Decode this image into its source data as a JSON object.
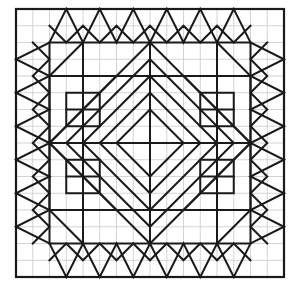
{
  "figure": {
    "title": "Geometric quilt block tessellation pattern",
    "canvas": {
      "width": 298,
      "height": 288
    },
    "plot_area": {
      "x": 16,
      "y": 9,
      "width": 268,
      "height": 268
    },
    "grid": {
      "cells_x": 16,
      "cells_y": 16,
      "cell_size": 16.75
    },
    "colors": {
      "background": "#ffffff",
      "minor_grid": "#c9c9c9",
      "major_line": "#1a1a1a",
      "border": "#1a1a1a"
    },
    "stroke_widths": {
      "minor_grid": 0.8,
      "major_line": 2.0,
      "border": 2.2
    }
  },
  "chart_data": {
    "type": "line",
    "title": "Geometric quilt block tessellation pattern",
    "xlabel": "",
    "ylabel": "",
    "xlim": [
      0,
      16
    ],
    "ylim": [
      0,
      16
    ],
    "grid": true,
    "legend": "none",
    "units": "grid cells",
    "minor_grid_lines": {
      "x": [
        0,
        1,
        2,
        3,
        4,
        5,
        6,
        7,
        8,
        9,
        10,
        11,
        12,
        13,
        14,
        15,
        16
      ],
      "y": [
        0,
        1,
        2,
        3,
        4,
        5,
        6,
        7,
        8,
        9,
        10,
        11,
        12,
        13,
        14,
        15,
        16
      ]
    },
    "series": [
      {
        "name": "outer-border",
        "closed": true,
        "points": [
          [
            0,
            0
          ],
          [
            16,
            0
          ],
          [
            16,
            16
          ],
          [
            0,
            16
          ]
        ]
      },
      {
        "name": "inner-frame-square",
        "closed": true,
        "points": [
          [
            2,
            2
          ],
          [
            14,
            2
          ],
          [
            14,
            14
          ],
          [
            2,
            14
          ]
        ]
      },
      {
        "name": "diamond-ring-1-outer",
        "closed": true,
        "points": [
          [
            8,
            2
          ],
          [
            14,
            8
          ],
          [
            8,
            14
          ],
          [
            2,
            8
          ]
        ]
      },
      {
        "name": "diamond-ring-2",
        "closed": true,
        "points": [
          [
            8,
            3
          ],
          [
            13,
            8
          ],
          [
            8,
            13
          ],
          [
            3,
            8
          ]
        ]
      },
      {
        "name": "diamond-ring-3",
        "closed": true,
        "points": [
          [
            8,
            4
          ],
          [
            12,
            8
          ],
          [
            8,
            12
          ],
          [
            4,
            8
          ]
        ]
      },
      {
        "name": "diamond-ring-4",
        "closed": true,
        "points": [
          [
            8,
            5
          ],
          [
            11,
            8
          ],
          [
            8,
            11
          ],
          [
            5,
            8
          ]
        ]
      },
      {
        "name": "diamond-ring-5-inner",
        "closed": true,
        "points": [
          [
            8,
            6
          ],
          [
            10,
            8
          ],
          [
            8,
            10
          ],
          [
            6,
            8
          ]
        ]
      },
      {
        "name": "center-vertical-axis",
        "closed": false,
        "points": [
          [
            8,
            2
          ],
          [
            8,
            14
          ]
        ]
      },
      {
        "name": "center-horizontal-axis",
        "closed": false,
        "points": [
          [
            2,
            8
          ],
          [
            14,
            8
          ]
        ]
      },
      {
        "name": "inner-frame-band-top",
        "closed": false,
        "points": [
          [
            2,
            4
          ],
          [
            14,
            4
          ]
        ]
      },
      {
        "name": "inner-frame-band-bottom",
        "closed": false,
        "points": [
          [
            2,
            12
          ],
          [
            14,
            12
          ]
        ]
      },
      {
        "name": "inner-frame-band-left",
        "closed": false,
        "points": [
          [
            4,
            2
          ],
          [
            4,
            14
          ]
        ]
      },
      {
        "name": "inner-frame-band-right",
        "closed": false,
        "points": [
          [
            12,
            2
          ],
          [
            12,
            14
          ]
        ]
      }
    ],
    "edge_bands": {
      "top": {
        "baseline_y": 2,
        "outer_y": 0,
        "peaks_x": [
          3,
          5,
          7,
          9,
          11,
          13
        ],
        "valleys_x": [
          2,
          4,
          6,
          8,
          10,
          12,
          14
        ]
      },
      "bottom": {
        "baseline_y": 14,
        "outer_y": 16,
        "peaks_x": [
          3,
          5,
          7,
          9,
          11,
          13
        ],
        "valleys_x": [
          2,
          4,
          6,
          8,
          10,
          12,
          14
        ]
      },
      "left": {
        "baseline_x": 2,
        "outer_x": 0,
        "peaks_y": [
          3,
          5,
          7,
          9,
          11,
          13
        ],
        "valleys_y": [
          2,
          4,
          6,
          8,
          10,
          12,
          14
        ]
      },
      "right": {
        "baseline_x": 14,
        "outer_x": 16,
        "peaks_y": [
          3,
          5,
          7,
          9,
          11,
          13
        ],
        "valleys_y": [
          2,
          4,
          6,
          8,
          10,
          12,
          14
        ]
      }
    },
    "corner_motifs": [
      {
        "name": "top-left-motif",
        "triangle": [
          [
            2,
            4
          ],
          [
            6,
            4
          ],
          [
            2,
            8
          ]
        ],
        "rect": [
          [
            3,
            5
          ],
          [
            5,
            5
          ],
          [
            5,
            7
          ],
          [
            3,
            7
          ]
        ],
        "split": [
          [
            3,
            6
          ],
          [
            5,
            6
          ]
        ]
      },
      {
        "name": "top-right-motif",
        "triangle": [
          [
            14,
            4
          ],
          [
            10,
            4
          ],
          [
            14,
            8
          ]
        ],
        "rect": [
          [
            11,
            5
          ],
          [
            13,
            5
          ],
          [
            13,
            7
          ],
          [
            11,
            7
          ]
        ],
        "split": [
          [
            11,
            6
          ],
          [
            13,
            6
          ]
        ]
      },
      {
        "name": "bottom-left-motif",
        "triangle": [
          [
            2,
            12
          ],
          [
            6,
            12
          ],
          [
            2,
            8
          ]
        ],
        "rect": [
          [
            3,
            9
          ],
          [
            5,
            9
          ],
          [
            5,
            11
          ],
          [
            3,
            11
          ]
        ],
        "split": [
          [
            3,
            10
          ],
          [
            5,
            10
          ]
        ]
      },
      {
        "name": "bottom-right-motif",
        "triangle": [
          [
            14,
            12
          ],
          [
            10,
            12
          ],
          [
            14,
            8
          ]
        ],
        "rect": [
          [
            11,
            9
          ],
          [
            13,
            9
          ],
          [
            13,
            11
          ],
          [
            11,
            11
          ]
        ],
        "split": [
          [
            11,
            10
          ],
          [
            13,
            10
          ]
        ]
      }
    ],
    "corner_diagonals": [
      {
        "name": "tl-diagonal",
        "points": [
          [
            2,
            4
          ],
          [
            4,
            2
          ]
        ]
      },
      {
        "name": "tr-diagonal",
        "points": [
          [
            14,
            4
          ],
          [
            12,
            2
          ]
        ]
      },
      {
        "name": "bl-diagonal",
        "points": [
          [
            2,
            12
          ],
          [
            4,
            14
          ]
        ]
      },
      {
        "name": "br-diagonal",
        "points": [
          [
            14,
            12
          ],
          [
            12,
            14
          ]
        ]
      }
    ],
    "values": [],
    "categories": []
  }
}
